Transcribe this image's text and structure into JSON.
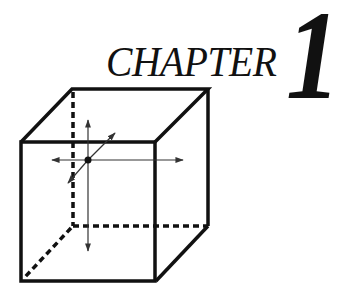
{
  "heading": {
    "label": "CHAPTER",
    "number": "1"
  },
  "figure": {
    "line_color": "#111111"
  }
}
